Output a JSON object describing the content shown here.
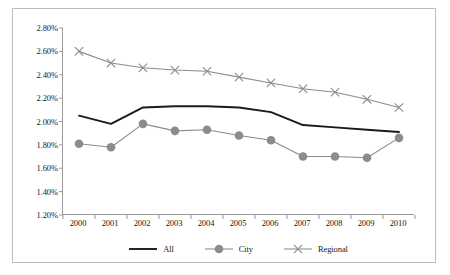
{
  "chart_data": {
    "type": "line",
    "title": "",
    "subtitle": "",
    "xlabel": "",
    "ylabel": "",
    "categories": [
      "2000",
      "2001",
      "2002",
      "2003",
      "2004",
      "2005",
      "2006",
      "2007",
      "2008",
      "2009",
      "2010"
    ],
    "x": [
      2000,
      2001,
      2002,
      2003,
      2004,
      2005,
      2006,
      2007,
      2008,
      2009,
      2010
    ],
    "ylim": [
      1.2,
      2.8
    ],
    "y_tick_labels": [
      "2.80%",
      "2.60%",
      "2.40%",
      "2.20%",
      "2.00%",
      "1.80%",
      "1.60%",
      "1.40%",
      "1.20%"
    ],
    "y_tick_values": [
      2.8,
      2.6,
      2.4,
      2.2,
      2.0,
      1.8,
      1.6,
      1.4,
      1.2
    ],
    "y_unit": "%",
    "grid": false,
    "legend_position": "bottom",
    "series": [
      {
        "name": "All",
        "color": "#1a1a1a",
        "marker": "none",
        "values": [
          2.05,
          1.98,
          2.12,
          2.13,
          2.13,
          2.12,
          2.08,
          1.97,
          1.95,
          1.93,
          1.91
        ]
      },
      {
        "name": "City",
        "color": "#8c8c8c",
        "marker": "circle",
        "values": [
          1.81,
          1.78,
          1.98,
          1.92,
          1.93,
          1.88,
          1.84,
          1.7,
          1.7,
          1.69,
          1.86
        ]
      },
      {
        "name": "Regional",
        "color": "#8c8c8c",
        "marker": "x",
        "values": [
          2.6,
          2.5,
          2.46,
          2.44,
          2.43,
          2.38,
          2.33,
          2.28,
          2.25,
          2.19,
          2.12
        ]
      }
    ]
  },
  "legend": {
    "items": [
      {
        "label": "All"
      },
      {
        "label": "City"
      },
      {
        "label": "Regional"
      }
    ]
  },
  "colors": {
    "all_series": "#1a1a1a",
    "city_series": "#8c8c8c",
    "regional_series": "#8c8c8c",
    "axis": "#9a9a9a",
    "frame": "#bdbdbd",
    "text": "#1a1a1a",
    "background": "#ffffff"
  }
}
